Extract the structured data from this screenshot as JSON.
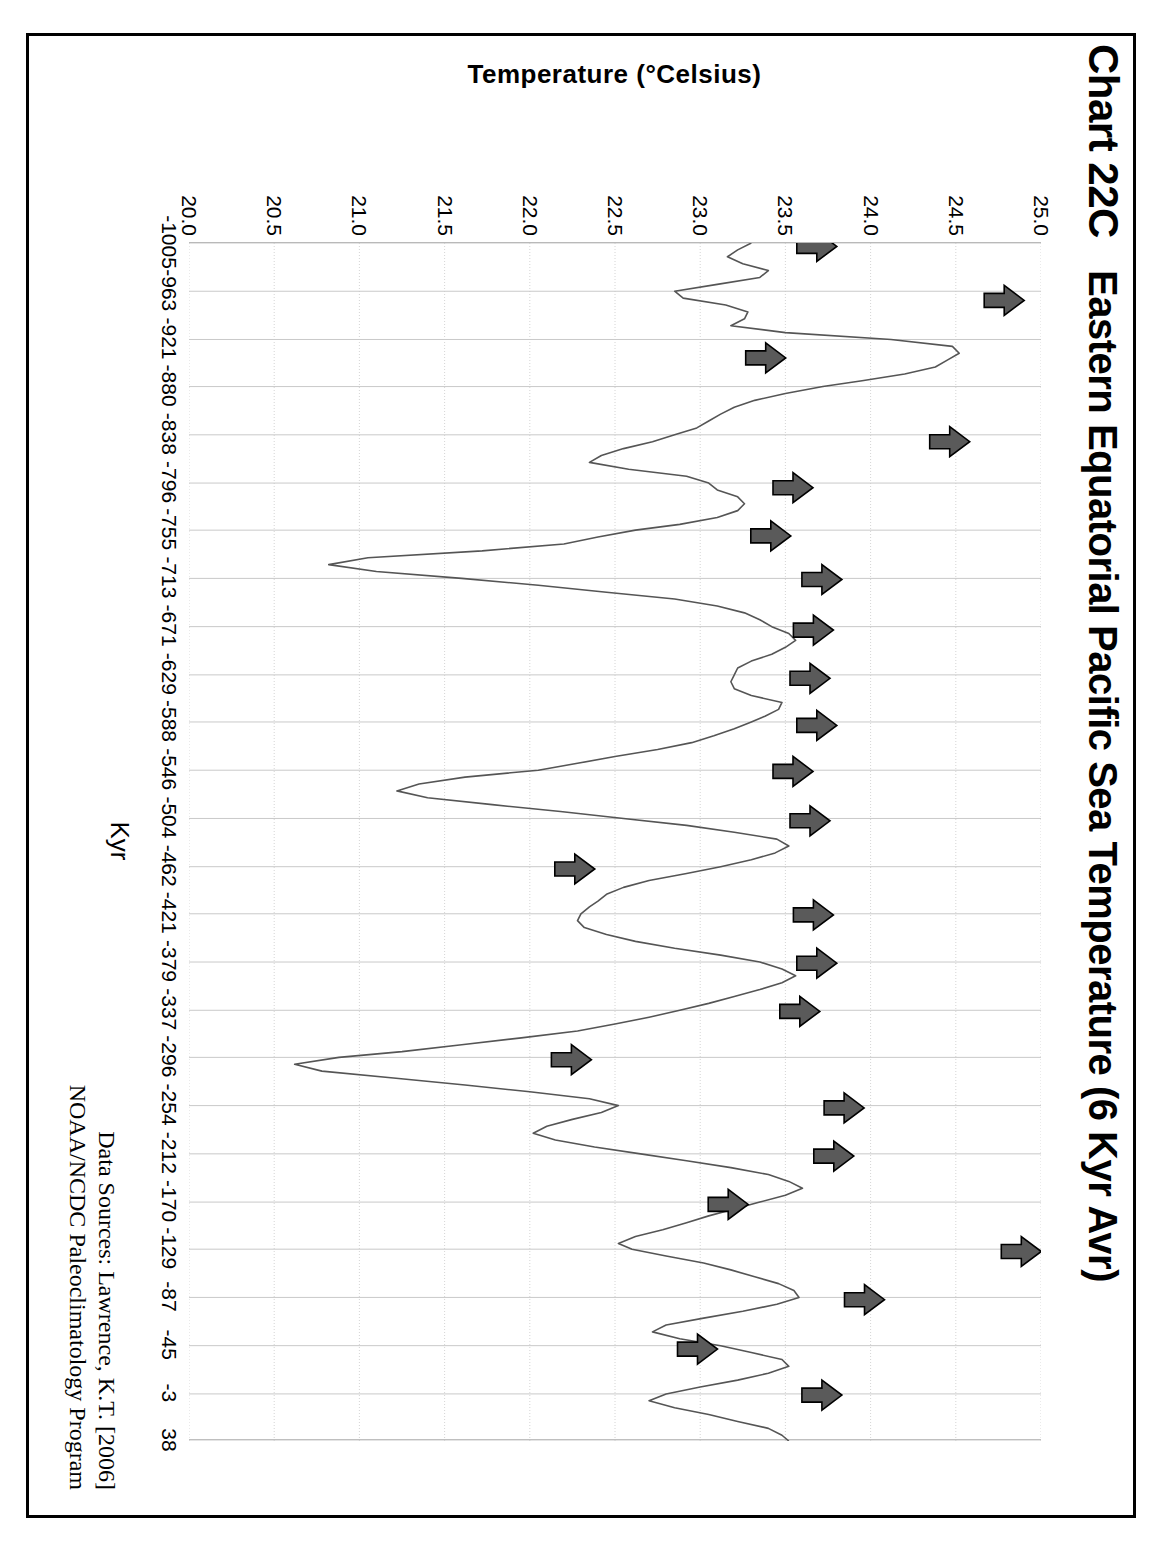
{
  "figure": {
    "chart_id": "Chart 22C",
    "title": "Eastern Equatorial Pacific Sea Temperature (6 Kyr Avr)"
  },
  "source": {
    "line1": "Data Sources:  Lawrence, K.T. [2006]",
    "line2": "NOAA/NCDC Paleoclimatology Program"
  },
  "axes": {
    "x_title": "Kyr",
    "y_title": "Temperature (°Celsius)",
    "x_ticks": [
      "-1005",
      "-963",
      "-921",
      "-880",
      "-838",
      "-796",
      "-755",
      "-713",
      "-671",
      "-629",
      "-588",
      "-546",
      "-504",
      "-462",
      "-421",
      "-379",
      "-337",
      "-296",
      "-254",
      "-212",
      "-170",
      "-129",
      "-87",
      "-45",
      "-3",
      "38"
    ],
    "y_ticks": [
      "25.0",
      "24.5",
      "24.0",
      "23.5",
      "23.0",
      "22.5",
      "22.0",
      "21.5",
      "21.0",
      "20.5",
      "20.0"
    ]
  },
  "chart_data": {
    "type": "line",
    "title": "Eastern Equatorial Pacific Sea Temperature (6 Kyr Avr)",
    "xlabel": "Kyr",
    "ylabel": "Temperature (°Celsius)",
    "xlim": [
      -1005,
      38
    ],
    "ylim": [
      20.0,
      25.0
    ],
    "y_inverted": true,
    "grid": true,
    "legend": "none",
    "series_name": "Eastern Equatorial Pacific SST (6 Kyr average)",
    "x": [
      -1005,
      -999,
      -993,
      -987,
      -981,
      -975,
      -969,
      -963,
      -957,
      -951,
      -945,
      -939,
      -933,
      -927,
      -921,
      -915,
      -909,
      -903,
      -897,
      -891,
      -885,
      -880,
      -874,
      -868,
      -862,
      -856,
      -850,
      -844,
      -838,
      -832,
      -826,
      -820,
      -814,
      -808,
      -802,
      -796,
      -790,
      -784,
      -778,
      -772,
      -766,
      -760,
      -755,
      -749,
      -743,
      -737,
      -731,
      -725,
      -719,
      -713,
      -707,
      -701,
      -695,
      -689,
      -683,
      -677,
      -671,
      -665,
      -659,
      -653,
      -647,
      -641,
      -635,
      -629,
      -623,
      -617,
      -611,
      -605,
      -599,
      -593,
      -588,
      -582,
      -576,
      -570,
      -564,
      -558,
      -552,
      -546,
      -540,
      -534,
      -528,
      -522,
      -516,
      -510,
      -504,
      -498,
      -492,
      -486,
      -480,
      -474,
      -468,
      -462,
      -456,
      -450,
      -444,
      -438,
      -432,
      -427,
      -421,
      -415,
      -409,
      -403,
      -397,
      -391,
      -385,
      -379,
      -373,
      -367,
      -361,
      -355,
      -349,
      -343,
      -337,
      -331,
      -325,
      -319,
      -313,
      -307,
      -301,
      -296,
      -290,
      -284,
      -278,
      -272,
      -266,
      -260,
      -254,
      -248,
      -242,
      -236,
      -230,
      -224,
      -218,
      -212,
      -206,
      -200,
      -194,
      -188,
      -182,
      -176,
      -170,
      -164,
      -158,
      -152,
      -146,
      -140,
      -134,
      -129,
      -123,
      -117,
      -111,
      -105,
      -99,
      -93,
      -87,
      -81,
      -75,
      -69,
      -63,
      -57,
      -51,
      -45,
      -39,
      -33,
      -27,
      -21,
      -15,
      -9,
      -3,
      3,
      9,
      15,
      21,
      27,
      33,
      38
    ],
    "y": [
      23.3,
      23.22,
      23.16,
      23.25,
      23.4,
      23.35,
      23.1,
      22.85,
      22.9,
      23.15,
      23.28,
      23.26,
      23.18,
      23.5,
      24.12,
      24.48,
      24.52,
      24.45,
      24.38,
      24.2,
      23.95,
      23.72,
      23.5,
      23.32,
      23.2,
      23.12,
      23.05,
      22.98,
      22.85,
      22.72,
      22.55,
      22.42,
      22.35,
      22.58,
      22.92,
      23.05,
      23.1,
      23.22,
      23.26,
      23.22,
      23.1,
      22.88,
      22.62,
      22.4,
      22.2,
      21.72,
      21.05,
      20.82,
      21.1,
      21.6,
      22.05,
      22.45,
      22.85,
      23.1,
      23.26,
      23.35,
      23.42,
      23.52,
      23.56,
      23.5,
      23.42,
      23.3,
      23.22,
      23.2,
      23.18,
      23.2,
      23.3,
      23.48,
      23.46,
      23.38,
      23.3,
      23.2,
      23.08,
      22.95,
      22.75,
      22.5,
      22.28,
      22.05,
      21.62,
      21.35,
      21.22,
      21.4,
      21.78,
      22.18,
      22.55,
      22.92,
      23.2,
      23.45,
      23.52,
      23.44,
      23.3,
      23.12,
      22.92,
      22.7,
      22.55,
      22.45,
      22.4,
      22.35,
      22.3,
      22.28,
      22.32,
      22.45,
      22.62,
      22.85,
      23.12,
      23.35,
      23.48,
      23.56,
      23.48,
      23.35,
      23.2,
      23.05,
      22.88,
      22.7,
      22.5,
      22.28,
      21.95,
      21.6,
      21.25,
      20.88,
      20.62,
      20.78,
      21.2,
      21.62,
      22.0,
      22.35,
      22.52,
      22.42,
      22.25,
      22.1,
      22.02,
      22.15,
      22.38,
      22.65,
      22.92,
      23.18,
      23.4,
      23.52,
      23.6,
      23.5,
      23.35,
      23.2,
      23.05,
      22.92,
      22.78,
      22.62,
      22.52,
      22.6,
      22.8,
      23.02,
      23.18,
      23.32,
      23.46,
      23.55,
      23.58,
      23.45,
      23.25,
      23.02,
      22.8,
      22.72,
      22.88,
      23.12,
      23.3,
      23.48,
      23.52,
      23.4,
      23.22,
      23.0,
      22.8,
      22.7,
      22.85,
      23.05,
      23.22,
      23.4,
      23.48,
      23.52,
      23.5,
      23.46,
      23.42,
      23.5,
      23.58,
      23.62,
      23.55,
      23.45
    ],
    "markers": {
      "label": "interglacial-peak-arrow",
      "description": "Filled grey/black right-pointing arrows annotating successive interglacial temperature maxima",
      "count": 24,
      "at_x": [
        -1002,
        -955,
        -905,
        -832,
        -792,
        -750,
        -712,
        -668,
        -626,
        -585,
        -545,
        -502,
        -460,
        -420,
        -378,
        -336,
        -294,
        -252,
        -210,
        -168,
        -127,
        -85,
        -42,
        -2
      ],
      "at_y": [
        23.52,
        24.62,
        23.22,
        24.3,
        23.38,
        23.25,
        23.55,
        23.5,
        23.48,
        23.52,
        23.38,
        23.48,
        22.1,
        23.5,
        23.52,
        23.42,
        22.08,
        23.68,
        23.62,
        23.0,
        24.72,
        23.8,
        22.82,
        23.55
      ]
    }
  },
  "colors": {
    "line": "#555555",
    "arrow_fill": "#5a5a5a",
    "arrow_stroke": "#000000",
    "grid": "#c9c9c9",
    "frame": "#000000",
    "text": "#000000"
  }
}
